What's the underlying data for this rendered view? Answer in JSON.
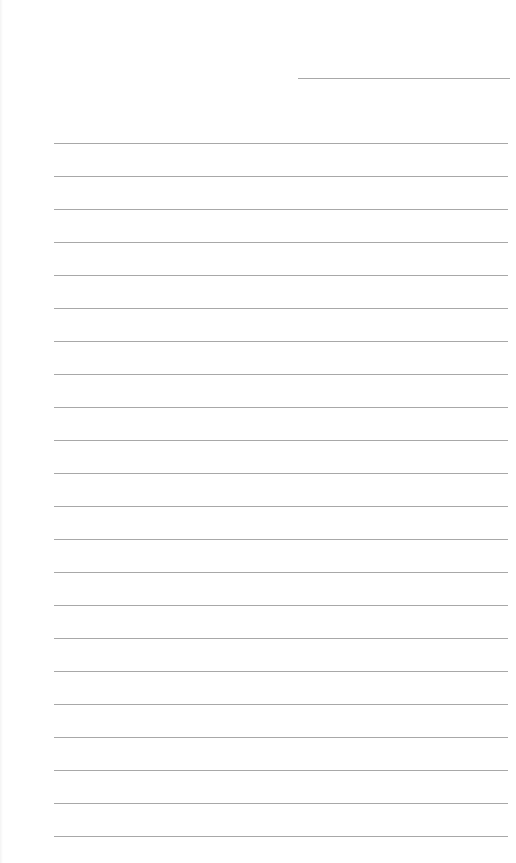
{
  "page": {
    "type": "lined-writing-sheet",
    "background_color": "#ffffff",
    "line_color": "#a8a8a8"
  },
  "header": {
    "field_line": {
      "x": 298,
      "y": 78,
      "width": 212
    }
  },
  "ruled_lines": {
    "count": 22,
    "start_y": 143,
    "spacing": 33,
    "x": 54,
    "width": 454
  }
}
